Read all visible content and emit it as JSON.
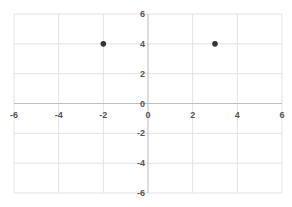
{
  "chart_data": {
    "type": "scatter",
    "title": "",
    "xlabel": "",
    "ylabel": "",
    "xlim": [
      -6,
      6
    ],
    "ylim": [
      -6,
      6
    ],
    "grid": true,
    "grid_step": 2,
    "x_ticks": [
      -6,
      -4,
      -2,
      0,
      2,
      4,
      6
    ],
    "y_ticks": [
      6,
      4,
      2,
      0,
      -2,
      -4,
      -6
    ],
    "series": [
      {
        "name": "points",
        "color": "#333333",
        "points": [
          {
            "x": -2,
            "y": 4
          },
          {
            "x": 3,
            "y": 4
          }
        ]
      }
    ],
    "legend": null
  },
  "colors": {
    "grid": "#e3e3e3",
    "axis": "#bdbdbd",
    "tick_label": "#555555",
    "point": "#333333"
  }
}
